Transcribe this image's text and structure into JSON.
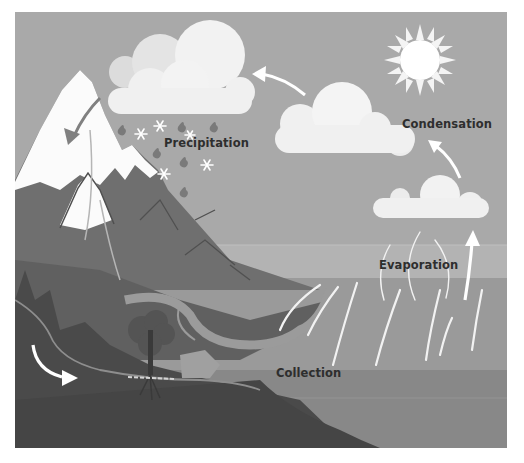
{
  "diagram": {
    "labels": {
      "precipitation": "Precipitation",
      "condensation": "Condensation",
      "evaporation": "Evaporation",
      "collection": "Collection"
    },
    "elements": [
      "sun",
      "rain-cloud",
      "condensation-cloud",
      "evaporation-cloud",
      "snow-capped-mountains",
      "river",
      "tree",
      "sea",
      "groundwater-arrow",
      "precipitation-arrow",
      "condensation-arrows",
      "evaporation-wisps"
    ],
    "colors": {
      "page_bg": "#ffffff",
      "sky": "#a9a9a9",
      "sky_haze": "#b3b3b3",
      "cloud": "#efefef",
      "cloud_shadow": "#dcdcdc",
      "sun": "#ffffff",
      "snow": "#fbfbfb",
      "mountain": "#6f6f6f",
      "mountain_dark": "#5a5a5a",
      "foreground_hill": "#4c4c4c",
      "ground": "#454545",
      "river": "#9b9b9b",
      "sea": "#9a9a9a",
      "sea_deep": "#888888",
      "arrow": "#ffffff",
      "rain_arrow": "#808080",
      "raindrop": "#7a7a7a",
      "label_text": "#2e2e2e"
    }
  }
}
